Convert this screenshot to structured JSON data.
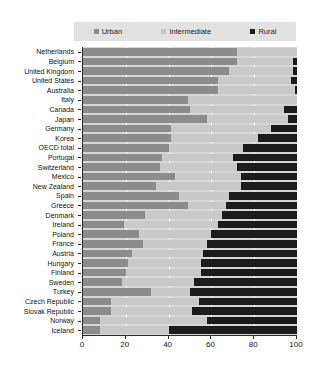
{
  "chart_data": {
    "type": "bar",
    "orientation": "horizontal",
    "stacked": true,
    "title": "",
    "xlabel": "",
    "ylabel": "",
    "xlim": [
      0,
      100
    ],
    "xticks": [
      0,
      20,
      40,
      60,
      80,
      100
    ],
    "grid": true,
    "legend_position": "top",
    "colors": {
      "urban": "#8c8c8c",
      "intermediate": "#c9c9c9",
      "rural": "#1c1c1c",
      "plot_background": "#d6d6d6",
      "legend_background": "#e2e2e2",
      "axis": "#2b2b2b",
      "gridline": "#ffffff"
    },
    "legend": [
      {
        "label": "Urban",
        "key": "urban",
        "color": "#8c8c8c"
      },
      {
        "label": "Intermediate",
        "key": "intermediate",
        "color": "#c9c9c9"
      },
      {
        "label": "Rural",
        "key": "rural",
        "color": "#1c1c1c"
      }
    ],
    "categories": [
      "Netherlands",
      "Belgium",
      "United Kingdom",
      "United States",
      "Australia",
      "Italy",
      "Canada",
      "Japan",
      "Germany",
      "Korea",
      "OECD total",
      "Portugal",
      "Switzerland",
      "Mexico",
      "New Zealand",
      "Spain",
      "Greece",
      "Denmark",
      "Ireland",
      "Poland",
      "France",
      "Austria",
      "Hungary",
      "Finland",
      "Sweden",
      "Turkey",
      "Czech Republic",
      "Slovak Republic",
      "Norway",
      "Iceland"
    ],
    "series": [
      {
        "name": "Urban",
        "values": [
          72,
          72,
          68,
          63,
          63,
          49,
          50,
          58,
          41,
          41,
          40,
          37,
          36,
          43,
          34,
          45,
          49,
          29,
          19,
          26,
          28,
          23,
          21,
          20,
          18,
          32,
          13,
          13,
          8,
          8
        ]
      },
      {
        "name": "Intermediate",
        "values": [
          28,
          26,
          30,
          34,
          36,
          51,
          44,
          38,
          47,
          41,
          35,
          33,
          36,
          31,
          40,
          23,
          18,
          36,
          44,
          34,
          30,
          33,
          34,
          35,
          34,
          18,
          41,
          38,
          50,
          32
        ]
      },
      {
        "name": "Rural",
        "values": [
          0,
          2,
          2,
          3,
          1,
          0,
          6,
          4,
          12,
          18,
          25,
          30,
          28,
          26,
          26,
          32,
          33,
          35,
          37,
          40,
          42,
          44,
          45,
          45,
          48,
          50,
          46,
          49,
          42,
          60
        ]
      }
    ],
    "rows": [
      {
        "label": "Netherlands",
        "urban": 72,
        "intermediate": 28,
        "rural": 0
      },
      {
        "label": "Belgium",
        "urban": 72,
        "intermediate": 26,
        "rural": 2
      },
      {
        "label": "United Kingdom",
        "urban": 68,
        "intermediate": 30,
        "rural": 2
      },
      {
        "label": "United States",
        "urban": 63,
        "intermediate": 34,
        "rural": 3
      },
      {
        "label": "Australia",
        "urban": 63,
        "intermediate": 36,
        "rural": 1
      },
      {
        "label": "Italy",
        "urban": 49,
        "intermediate": 51,
        "rural": 0
      },
      {
        "label": "Canada",
        "urban": 50,
        "intermediate": 44,
        "rural": 6
      },
      {
        "label": "Japan",
        "urban": 58,
        "intermediate": 38,
        "rural": 4
      },
      {
        "label": "Germany",
        "urban": 41,
        "intermediate": 47,
        "rural": 12
      },
      {
        "label": "Korea",
        "urban": 41,
        "intermediate": 41,
        "rural": 18
      },
      {
        "label": "OECD total",
        "urban": 40,
        "intermediate": 35,
        "rural": 25
      },
      {
        "label": "Portugal",
        "urban": 37,
        "intermediate": 33,
        "rural": 30
      },
      {
        "label": "Switzerland",
        "urban": 36,
        "intermediate": 36,
        "rural": 28
      },
      {
        "label": "Mexico",
        "urban": 43,
        "intermediate": 31,
        "rural": 26
      },
      {
        "label": "New Zealand",
        "urban": 34,
        "intermediate": 40,
        "rural": 26
      },
      {
        "label": "Spain",
        "urban": 45,
        "intermediate": 23,
        "rural": 32
      },
      {
        "label": "Greece",
        "urban": 49,
        "intermediate": 18,
        "rural": 33
      },
      {
        "label": "Denmark",
        "urban": 29,
        "intermediate": 36,
        "rural": 35
      },
      {
        "label": "Ireland",
        "urban": 19,
        "intermediate": 44,
        "rural": 37
      },
      {
        "label": "Poland",
        "urban": 26,
        "intermediate": 34,
        "rural": 40
      },
      {
        "label": "France",
        "urban": 28,
        "intermediate": 30,
        "rural": 42
      },
      {
        "label": "Austria",
        "urban": 23,
        "intermediate": 33,
        "rural": 44
      },
      {
        "label": "Hungary",
        "urban": 21,
        "intermediate": 34,
        "rural": 45
      },
      {
        "label": "Finland",
        "urban": 20,
        "intermediate": 35,
        "rural": 45
      },
      {
        "label": "Sweden",
        "urban": 18,
        "intermediate": 34,
        "rural": 48
      },
      {
        "label": "Turkey",
        "urban": 32,
        "intermediate": 18,
        "rural": 50
      },
      {
        "label": "Czech Republic",
        "urban": 13,
        "intermediate": 41,
        "rural": 46
      },
      {
        "label": "Slovak Republic",
        "urban": 13,
        "intermediate": 38,
        "rural": 49
      },
      {
        "label": "Norway",
        "urban": 8,
        "intermediate": 50,
        "rural": 42
      },
      {
        "label": "Iceland",
        "urban": 8,
        "intermediate": 32,
        "rural": 60
      }
    ]
  }
}
